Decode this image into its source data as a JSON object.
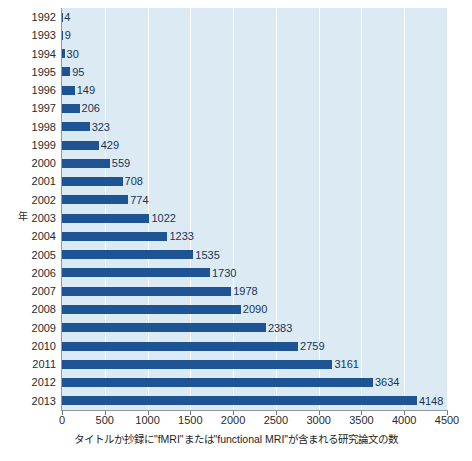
{
  "chart_data": {
    "type": "bar",
    "orientation": "horizontal",
    "title": "",
    "subtitle": "",
    "xlabel": "タイトルか抄録に\"fMRI\"または\"functional MRI\"が含まれる研究論文の数",
    "ylabel": "年",
    "categories": [
      "1992",
      "1993",
      "1994",
      "1995",
      "1996",
      "1997",
      "1998",
      "1999",
      "2000",
      "2001",
      "2002",
      "2003",
      "2004",
      "2005",
      "2006",
      "2007",
      "2008",
      "2009",
      "2010",
      "2011",
      "2012",
      "2013"
    ],
    "values": [
      4,
      9,
      30,
      95,
      149,
      206,
      323,
      429,
      559,
      708,
      774,
      1022,
      1233,
      1535,
      1730,
      1978,
      2090,
      2383,
      2759,
      3161,
      3634,
      4148
    ],
    "data_labels": [
      "4",
      "9",
      "30",
      "95",
      "149",
      "206",
      "323",
      "429",
      "559",
      "708",
      "774",
      "1022",
      "1233",
      "1535",
      "1730",
      "1978",
      "2090",
      "2383",
      "2759",
      "3161",
      "3634",
      "4148"
    ],
    "xlim": [
      0,
      4500
    ],
    "xticks": [
      0,
      500,
      1000,
      1500,
      2000,
      2500,
      3000,
      3500,
      4000,
      4500
    ],
    "xtick_labels": [
      "0",
      "500",
      "1000",
      "1500",
      "2000",
      "2500",
      "3000",
      "3500",
      "4000",
      "4500"
    ],
    "grid": "vertical",
    "legend": "none",
    "colors": {
      "bar": "#1e5394",
      "plot_background": "#dcebf3",
      "gridline": "#ffffff",
      "axis_line": "#8c9aa3",
      "data_label_text": "#16335c",
      "tick_text": "#2a2a2a",
      "figure_background": "#ffffff"
    }
  }
}
